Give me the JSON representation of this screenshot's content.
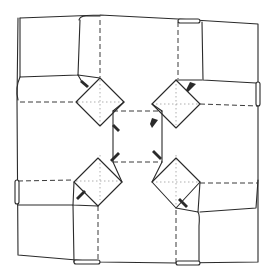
{
  "diagram": {
    "type": "origami-fold-diagram",
    "colors": {
      "background": "#ffffff",
      "line": "#2a2a2a",
      "valley_fold": "#3a3a3a",
      "crease": "#9a9a9a"
    },
    "legend": {
      "solid": "edge / fold edge",
      "dashed": "valley fold",
      "dotted": "existing crease"
    },
    "elements": {
      "outer_square": "outer paper boundary",
      "corner_flaps": [
        "top-left flap",
        "top-right flap",
        "bottom-left flap",
        "bottom-right flap"
      ],
      "side_rolls": [
        "top roll",
        "right roll",
        "bottom roll",
        "left roll"
      ],
      "diamonds": [
        "top-left diamond",
        "top-right diamond",
        "bottom-left diamond",
        "bottom-right diamond"
      ],
      "center": "central square"
    }
  }
}
